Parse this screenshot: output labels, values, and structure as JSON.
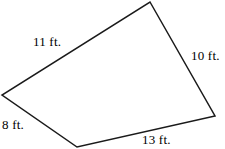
{
  "figure": {
    "name": "quadrilateral-with-side-lengths",
    "shape_type": "quadrilateral",
    "units": "ft.",
    "stroke_color": "#1a1a1a",
    "fill_color": "#ffffff",
    "background_color": "#ffffff",
    "stroke_width": 1.5,
    "vertices": [
      {
        "name": "top",
        "x": 150,
        "y": 2
      },
      {
        "name": "right",
        "x": 215,
        "y": 116
      },
      {
        "name": "bottom",
        "x": 77,
        "y": 147
      },
      {
        "name": "left",
        "x": 2,
        "y": 95
      }
    ],
    "polygon_points": "150,2 215,116 77,147 2,95",
    "sides": [
      {
        "id": "left-upper",
        "label": "11 ft.",
        "value": 11,
        "from": "left",
        "to": "top"
      },
      {
        "id": "right",
        "label": "10 ft.",
        "value": 10,
        "from": "top",
        "to": "right"
      },
      {
        "id": "bottom",
        "label": "13 ft.",
        "value": 13,
        "from": "bottom",
        "to": "right"
      },
      {
        "id": "left-lower",
        "label": "8 ft.",
        "value": 8,
        "from": "left",
        "to": "bottom"
      }
    ]
  }
}
